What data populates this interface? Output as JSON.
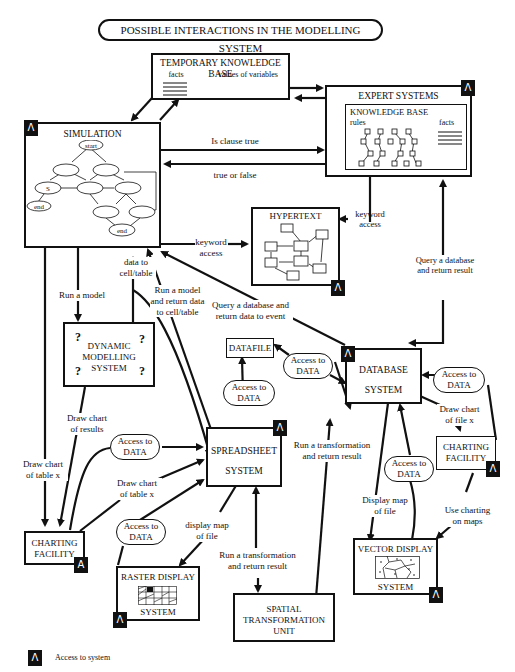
{
  "title": "POSSIBLE INTERACTIONS IN THE MODELLING SYSTEM",
  "access_badge_glyph": "Λ",
  "nodes": {
    "temporary_kb": {
      "title": "TEMPORARY KNOWLEDGE BASE",
      "facts": "facts",
      "values": "values of variables"
    },
    "expert_systems": {
      "title": "EXPERT SYSTEMS",
      "kb_title": "KNOWLEDGE BASE",
      "rules": "rules",
      "facts": "facts"
    },
    "simulation": {
      "title": "SIMULATION",
      "start": "start",
      "s": "S",
      "end1": "end",
      "end2": "end"
    },
    "hypertext": {
      "title": "HYPERTEXT"
    },
    "dynamic_modelling": {
      "line1": "DYNAMIC",
      "line2": "MODELLING",
      "line3": "SYSTEM",
      "mark": "?"
    },
    "datafile": {
      "title": "DATAFILE"
    },
    "database": {
      "line1": "DATABASE",
      "line2": "SYSTEM"
    },
    "spreadsheet": {
      "line1": "SPREADSHEET",
      "line2": "SYSTEM"
    },
    "charting_left": {
      "line1": "CHARTING",
      "line2": "FACILITY"
    },
    "charting_right": {
      "line1": "CHARTING",
      "line2": "FACILITY"
    },
    "raster_display": {
      "line1": "RASTER DISPLAY",
      "line2": "SYSTEM"
    },
    "vector_display": {
      "line1": "VECTOR DISPLAY",
      "line2": "SYSTEM"
    },
    "spatial_transformation": {
      "line1": "SPATIAL",
      "line2": "TRANSFORMATION",
      "line3": "UNIT"
    }
  },
  "access_data": {
    "line1": "Access to",
    "line2": "DATA"
  },
  "edge_labels": {
    "is_clause_true": "Is clause true",
    "true_or_false": "true or false",
    "keyword_access_sim": {
      "line1": "keyword",
      "line2": "access"
    },
    "keyword_access_exp": {
      "line1": "keyword",
      "line2": "access"
    },
    "query_db_return_result": {
      "line1": "Query a database",
      "line2": "and return result"
    },
    "run_a_model": "Run a model",
    "data_to_cell": {
      "line1": "data to",
      "line2": "cell/table"
    },
    "run_model_return": {
      "line1": "Run a model",
      "line2": "and return data",
      "line3": "to cell/table"
    },
    "query_db_event": {
      "line1": "Query a database and",
      "line2": "return data to event"
    },
    "draw_chart_results": {
      "line1": "Draw chart",
      "line2": "of results"
    },
    "draw_chart_table_left": {
      "line1": "Draw chart",
      "line2": "of table x"
    },
    "draw_chart_table_mid": {
      "line1": "Draw chart",
      "line2": "of table x"
    },
    "draw_chart_file": {
      "line1": "Draw chart",
      "line2": "of file x"
    },
    "run_transformation_db": {
      "line1": "Run a transformation",
      "line2": "and return result"
    },
    "run_transformation_ss": {
      "line1": "Run a transformation",
      "line2": "and return result"
    },
    "display_map_file_ss": {
      "line1": "display map",
      "line2": "of file"
    },
    "display_map_file_db": {
      "line1": "Display map",
      "line2": "of file"
    },
    "use_charting_maps": {
      "line1": "Use charting",
      "line2": "on maps"
    }
  },
  "legend": {
    "glyph": "Λ",
    "label": "Access to system"
  }
}
